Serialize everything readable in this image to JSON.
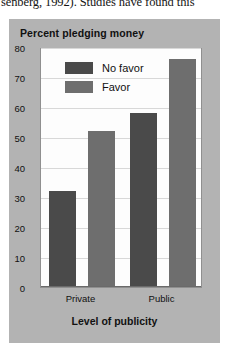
{
  "page": {
    "body_text_fragment": "senberg, 1992). Studies have found this"
  },
  "chart_data": {
    "type": "bar",
    "title": "Percent pledging money",
    "xlabel": "Level of publicity",
    "ylabel": "",
    "categories": [
      "Private",
      "Public"
    ],
    "series": [
      {
        "name": "No favor",
        "values": [
          32,
          58
        ],
        "color": "#4a4a4a"
      },
      {
        "name": "Favor",
        "values": [
          52,
          76
        ],
        "color": "#6e6e6e"
      }
    ],
    "ylim": [
      0,
      80
    ],
    "yticks": [
      0,
      10,
      20,
      30,
      40,
      50,
      60,
      70,
      80
    ],
    "ytick_labels": [
      "0",
      "10",
      "20",
      "30",
      "40",
      "50",
      "60",
      "70",
      "80"
    ],
    "grid": true,
    "legend_position": "upper left",
    "figure_background": "#b3b3b3",
    "plot_background": "#fdfdfd"
  }
}
